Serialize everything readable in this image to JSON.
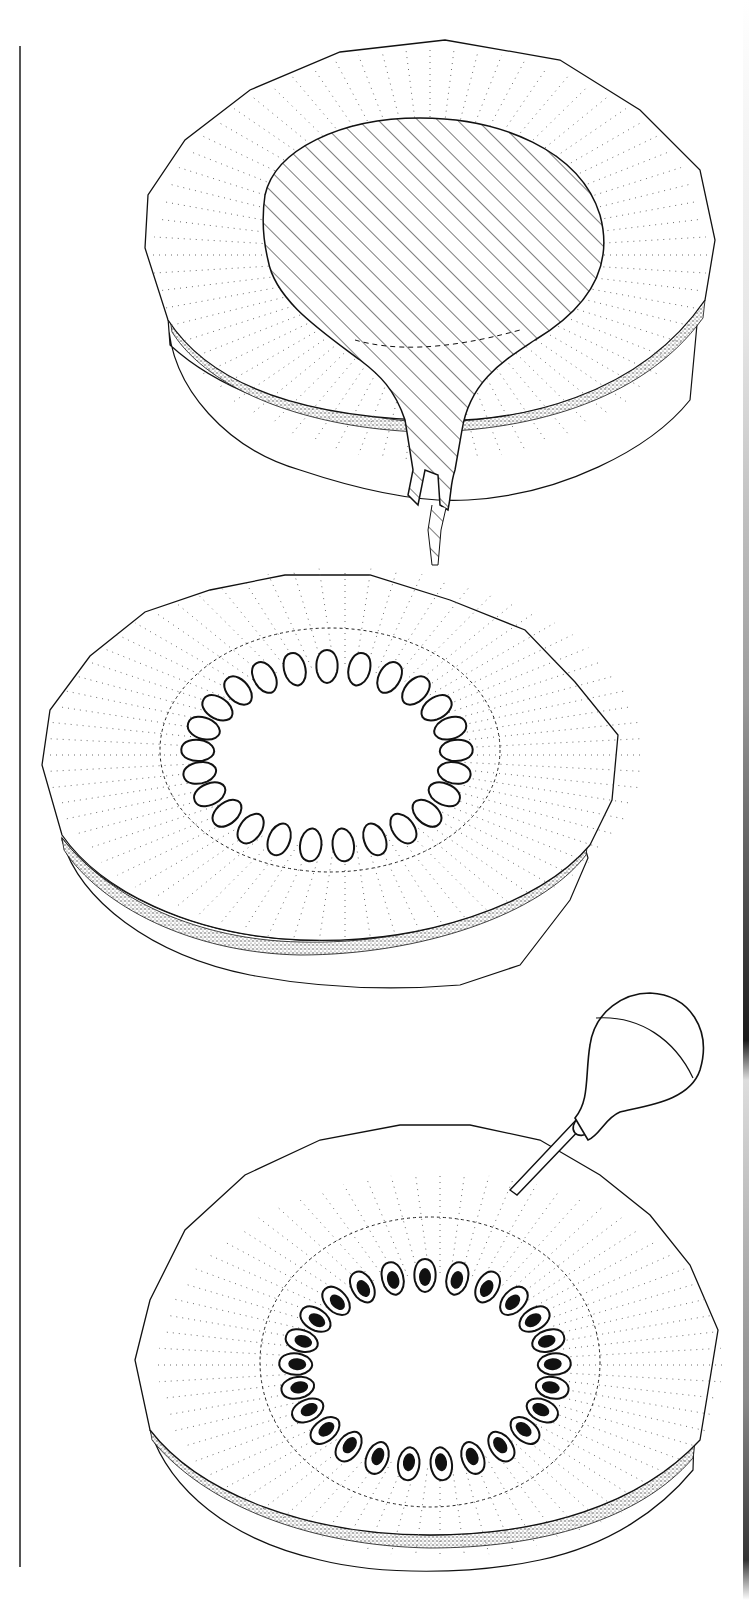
{
  "figure": {
    "title": "Three-stage illustration of a stem disk cross-section",
    "background": "#ffffff",
    "ink": "#111111",
    "stipple": "#6a6a6a",
    "margin_line": {
      "x": 19,
      "y_start": 46,
      "y_end": 1567,
      "color": "#555555"
    },
    "gutter": {
      "x": 743,
      "stops": [
        {
          "y": 0,
          "color": "#ffffff"
        },
        {
          "y": 330,
          "color": "#e6e6e6"
        },
        {
          "y": 700,
          "color": "#9a9a9a"
        },
        {
          "y": 1040,
          "color": "#1a1a1a"
        },
        {
          "y": 1080,
          "color": "#dddddd"
        },
        {
          "y": 1400,
          "color": "#8a8a8a"
        },
        {
          "y": 1560,
          "color": "#333333"
        },
        {
          "y": 1600,
          "color": "#ffffff"
        }
      ]
    }
  },
  "panels": [
    {
      "id": "panel-1",
      "label": "Disk with central hatched core and tapering extension",
      "disk": {
        "cx": 430,
        "cy": 255,
        "rx": 285,
        "ry": 215
      },
      "core": {
        "type": "hatched-teardrop",
        "hatch_angle": -45,
        "hatch_spacing": 14
      },
      "dashed_boundary": true,
      "radial_rays": 72,
      "bark_band": true
    },
    {
      "id": "panel-2",
      "label": "Disk with ring of empty holes",
      "disk": {
        "cx": 345,
        "cy": 755,
        "rx": 305,
        "ry": 195
      },
      "inner_dashed_ring": {
        "cx": 345,
        "cy": 745,
        "rx": 170,
        "ry": 120
      },
      "holes": {
        "count": 25,
        "cx": 327,
        "cy": 756,
        "rx": 130,
        "ry": 90,
        "filled": false
      },
      "radial_rays": 72,
      "bark_band": true
    },
    {
      "id": "panel-3",
      "label": "Disk with ring of filled holes and dropper bulb",
      "disk": {
        "cx": 440,
        "cy": 1365,
        "rx": 290,
        "ry": 200
      },
      "inner_dashed_ring": {
        "cx": 430,
        "cy": 1365,
        "rx": 170,
        "ry": 140
      },
      "holes": {
        "count": 25,
        "cx": 425,
        "cy": 1370,
        "rx": 130,
        "ry": 95,
        "filled": true
      },
      "radial_rays": 72,
      "bark_band": true,
      "dropper": {
        "bulb_cx": 645,
        "bulb_cy": 1050,
        "bulb_r": 58,
        "tip_x": 512,
        "tip_y": 1188,
        "collar_x": 583,
        "collar_y": 1120
      }
    }
  ]
}
